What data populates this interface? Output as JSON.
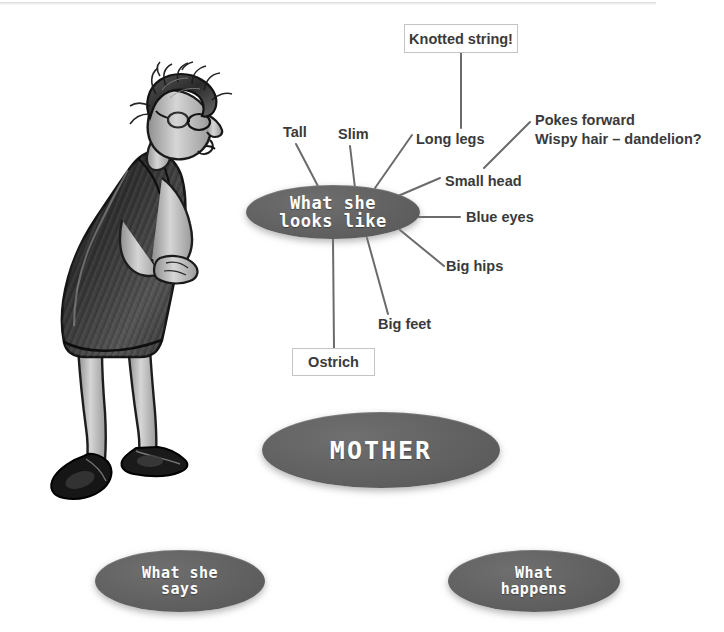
{
  "page": {
    "background_color": "#ffffff",
    "node_fill_color": "#616161",
    "node_text_color": "#ffffff",
    "label_text_color": "#3a3a3a",
    "connector_color": "#6b6b6b",
    "box_border_color": "#c4c4c4"
  },
  "illustration": {
    "name": "woman-leaning-forward-drawing",
    "description": "Hand-drawn greyscale sketch of a tall slim woman leaning forward, wearing glasses, wispy short hair, sleeveless dark patterned dress, long legs and large flat shoes"
  },
  "mindmap": {
    "center_node": {
      "label": "MOTHER"
    },
    "branch_nodes": [
      {
        "label": "What she\nlooks like"
      },
      {
        "label": "What she\nsays"
      },
      {
        "label": "What\nhappens"
      }
    ],
    "looks_like_branch": {
      "label": "What she\nlooks like",
      "leaves": [
        {
          "label": "Tall",
          "style": "plain"
        },
        {
          "label": "Slim",
          "style": "plain"
        },
        {
          "label": "Long legs",
          "style": "plain"
        },
        {
          "label": "Knotted string!",
          "style": "boxed"
        },
        {
          "label": "Pokes forward",
          "style": "plain"
        },
        {
          "label": "Wispy hair – dandelion?",
          "style": "plain"
        },
        {
          "label": "Small head",
          "style": "plain"
        },
        {
          "label": "Blue eyes",
          "style": "plain"
        },
        {
          "label": "Big hips",
          "style": "plain"
        },
        {
          "label": "Big feet",
          "style": "plain"
        },
        {
          "label": "Ostrich",
          "style": "boxed"
        }
      ]
    }
  }
}
